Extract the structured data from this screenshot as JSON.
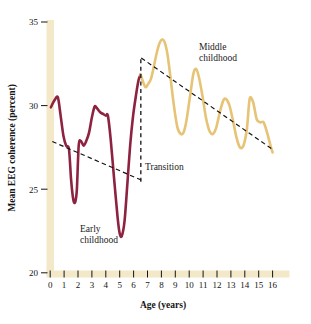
{
  "figure": {
    "name": "EEG coherence across childhood",
    "background": "#ffffff",
    "axis_band_color": "#f3e8c8"
  },
  "chart_data": {
    "type": "line",
    "title": "",
    "xlabel": "Age (years)",
    "ylabel": "Mean EEG coherence (percent)",
    "xlim": [
      0,
      16
    ],
    "ylim": [
      20,
      35
    ],
    "xticks": [
      0,
      1,
      2,
      3,
      4,
      5,
      6,
      7,
      8,
      9,
      10,
      11,
      12,
      13,
      14,
      15,
      16
    ],
    "xtick_labels": [
      "0",
      "1",
      "2",
      "3",
      "4",
      "5",
      "6",
      "7",
      "8",
      "9",
      "10",
      "11",
      "12",
      "13",
      "14",
      "15",
      "16"
    ],
    "yticks": [
      20,
      25,
      30,
      35
    ],
    "ytick_labels": [
      "20",
      "25",
      "30",
      "35"
    ],
    "grid": false,
    "legend": "none",
    "series": [
      {
        "name": "Early childhood",
        "color": "#8d2340",
        "linewidth": 2.6,
        "x": [
          0.05,
          0.3,
          0.55,
          0.75,
          0.95,
          1.15,
          1.35,
          1.5,
          1.62,
          1.72,
          1.82,
          1.92,
          2.05,
          2.2,
          2.4,
          2.6,
          2.8,
          3.0,
          3.2,
          3.4,
          3.6,
          3.8,
          4.0,
          4.15,
          4.35,
          4.6,
          4.85,
          5.0,
          5.15,
          5.35,
          5.55,
          5.75,
          5.95,
          6.15,
          6.35,
          6.5
        ],
        "y": [
          29.9,
          30.3,
          30.5,
          29.4,
          28.2,
          27.6,
          27.4,
          25.6,
          24.6,
          24.2,
          24.3,
          25.0,
          27.6,
          27.9,
          27.6,
          27.9,
          28.4,
          29.3,
          29.95,
          29.8,
          29.6,
          29.5,
          29.4,
          29.4,
          28.0,
          25.6,
          23.3,
          22.35,
          22.2,
          23.1,
          25.3,
          27.6,
          29.3,
          30.5,
          31.5,
          31.85
        ]
      },
      {
        "name": "Middle childhood",
        "color": "#e6c375",
        "linewidth": 2.6,
        "x": [
          6.5,
          6.65,
          6.85,
          7.05,
          7.25,
          7.45,
          7.65,
          7.85,
          8.05,
          8.25,
          8.45,
          8.65,
          8.9,
          9.15,
          9.4,
          9.6,
          9.8,
          10.05,
          10.3,
          10.5,
          10.7,
          10.95,
          11.2,
          11.45,
          11.7,
          11.95,
          12.2,
          12.45,
          12.65,
          12.9,
          13.15,
          13.4,
          13.65,
          13.9,
          14.15,
          14.35,
          14.6,
          14.85,
          15.1,
          15.35,
          15.6,
          15.85,
          16.0
        ],
        "y": [
          31.85,
          31.5,
          31.1,
          31.3,
          31.6,
          32.3,
          33.1,
          33.7,
          33.95,
          33.75,
          33.0,
          31.7,
          30.0,
          28.7,
          28.3,
          28.4,
          29.1,
          30.5,
          31.9,
          32.2,
          31.7,
          30.6,
          29.3,
          28.5,
          28.3,
          28.7,
          29.6,
          30.3,
          30.4,
          30.0,
          29.1,
          28.1,
          27.5,
          27.6,
          28.6,
          30.4,
          30.2,
          29.2,
          29.0,
          29.0,
          28.4,
          27.6,
          27.2
        ]
      }
    ],
    "trendlines": [
      {
        "name": "early-childhood-trend",
        "style": "dashed",
        "color": "#111111",
        "x": [
          0.15,
          6.55
        ],
        "y": [
          27.85,
          25.55
        ]
      },
      {
        "name": "middle-childhood-trend",
        "style": "dashed",
        "color": "#111111",
        "x": [
          6.55,
          16.05
        ],
        "y": [
          32.85,
          27.35
        ]
      }
    ],
    "markers": [
      {
        "name": "transition-divider",
        "type": "vertical-dashed-line",
        "x": 6.52,
        "y_from": 25.45,
        "y_to": 32.95,
        "color": "#111111"
      }
    ],
    "annotations": [
      {
        "name": "early-childhood-label",
        "lines": [
          "Early",
          "childhood"
        ],
        "x": 3.0,
        "y": 23.0
      },
      {
        "name": "middle-childhood-label",
        "lines": [
          "Middle",
          "childhood"
        ],
        "x": 11.2,
        "y": 33.6
      },
      {
        "name": "transition-label",
        "lines": [
          "Transition"
        ],
        "x": 6.9,
        "y": 26.2
      }
    ]
  }
}
